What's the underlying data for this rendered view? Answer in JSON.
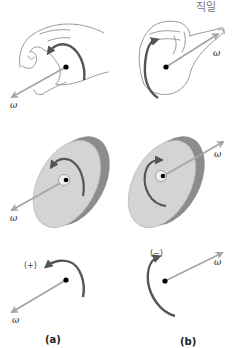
{
  "header": {
    "korean_text": "직일"
  },
  "panels": [
    {
      "id": "a",
      "caption": "(a)",
      "hand": {
        "omega_label": "ω",
        "direction": "down-left"
      },
      "disc": {
        "omega_label": "ω",
        "rotation": "counterclockwise-arrow"
      },
      "abstract": {
        "omega_label": "ω",
        "sign": "(+)"
      }
    },
    {
      "id": "b",
      "caption": "(b)",
      "hand": {
        "omega_label": "ω",
        "direction": "up-right"
      },
      "disc": {
        "omega_label": "ω",
        "rotation": "clockwise-arrow"
      },
      "abstract": {
        "omega_label": "ω",
        "sign": "(−)"
      }
    }
  ],
  "colors": {
    "omega_arrow": "#a6a6a6",
    "rotation_arrow": "#555555",
    "disc_face": "#d4d4d4",
    "disc_rim": "#8c8c8c",
    "hand_outline": "#9a9a9a",
    "dot": "#000000"
  }
}
